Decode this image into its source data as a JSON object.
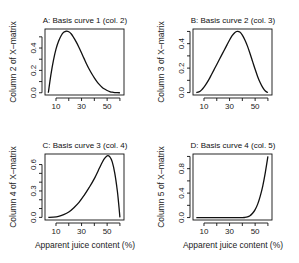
{
  "chart_data": [
    {
      "type": "line",
      "panel": "A",
      "title": "A: Basis curve 1 (col. 2)",
      "xlabel": "",
      "ylabel": "Column 2 of X–matrix",
      "xlim": [
        1.4,
        63.2
      ],
      "ylim": [
        -0.02,
        0.57
      ],
      "xticks": [
        10,
        20,
        30,
        40,
        50,
        60
      ],
      "xtick_labels": [
        "10",
        "",
        "30",
        "",
        "50",
        ""
      ],
      "yticks": [
        0.0,
        0.1,
        0.2,
        0.3,
        0.4,
        0.5
      ],
      "ytick_labels": [
        "0.0",
        "",
        "0.2",
        "",
        "0.4",
        ""
      ],
      "x": [
        4,
        6,
        8,
        10,
        12,
        14,
        16,
        18,
        20,
        22,
        24,
        26,
        28,
        30,
        32,
        34,
        36,
        38,
        40,
        42,
        44,
        46,
        48,
        50,
        52,
        54,
        56,
        58,
        60
      ],
      "y": [
        0.0,
        0.16,
        0.29,
        0.39,
        0.46,
        0.51,
        0.54,
        0.55,
        0.545,
        0.525,
        0.49,
        0.45,
        0.405,
        0.355,
        0.305,
        0.255,
        0.21,
        0.17,
        0.133,
        0.1,
        0.073,
        0.05,
        0.033,
        0.02,
        0.011,
        0.005,
        0.002,
        0.0005,
        0.0
      ]
    },
    {
      "type": "line",
      "panel": "B",
      "title": "B: Basis curve 2 (col. 3)",
      "xlabel": "",
      "ylabel": "Column 3 of X–matrix",
      "xlim": [
        1.4,
        63.2
      ],
      "ylim": [
        -0.02,
        0.52
      ],
      "xticks": [
        10,
        20,
        30,
        40,
        50,
        60
      ],
      "xtick_labels": [
        "10",
        "",
        "30",
        "",
        "50",
        ""
      ],
      "yticks": [
        0.0,
        0.1,
        0.2,
        0.3,
        0.4,
        0.5
      ],
      "ytick_labels": [
        "0.0",
        "",
        "0.2",
        "",
        "0.4",
        ""
      ],
      "x": [
        4,
        6,
        8,
        10,
        12,
        14,
        16,
        18,
        20,
        22,
        24,
        26,
        28,
        30,
        32,
        34,
        36,
        38,
        40,
        42,
        44,
        46,
        48,
        50,
        52,
        54,
        56,
        58,
        60
      ],
      "y": [
        0.0,
        0.005,
        0.02,
        0.045,
        0.075,
        0.11,
        0.15,
        0.19,
        0.23,
        0.27,
        0.31,
        0.35,
        0.39,
        0.43,
        0.465,
        0.49,
        0.5,
        0.495,
        0.47,
        0.43,
        0.38,
        0.32,
        0.255,
        0.19,
        0.13,
        0.08,
        0.04,
        0.012,
        0.0
      ]
    },
    {
      "type": "line",
      "panel": "C",
      "title": "C: Basis curve 3 (col. 4)",
      "xlabel": "Apparent juice content (%)",
      "ylabel": "Column 4 of X–matrix",
      "xlim": [
        1.4,
        63.2
      ],
      "ylim": [
        -0.03,
        0.72
      ],
      "xticks": [
        10,
        20,
        30,
        40,
        50,
        60
      ],
      "xtick_labels": [
        "10",
        "",
        "30",
        "",
        "50",
        ""
      ],
      "yticks": [
        0.0,
        0.1,
        0.2,
        0.3,
        0.4,
        0.5,
        0.6
      ],
      "ytick_labels": [
        "0.0",
        "",
        "",
        "0.3",
        "",
        "",
        "0.6"
      ],
      "x": [
        4,
        8,
        12,
        16,
        20,
        24,
        28,
        32,
        36,
        40,
        44,
        46,
        48,
        50,
        52,
        54,
        56,
        58,
        59,
        60
      ],
      "y": [
        0.0,
        0.002,
        0.01,
        0.03,
        0.06,
        0.11,
        0.17,
        0.25,
        0.34,
        0.44,
        0.56,
        0.62,
        0.67,
        0.7,
        0.69,
        0.63,
        0.5,
        0.3,
        0.16,
        0.0
      ]
    },
    {
      "type": "line",
      "panel": "D",
      "title": "D: Basis curve 4 (col. 5)",
      "xlabel": "Apparent juice content (%)",
      "ylabel": "Column 5 of X–matrix",
      "xlim": [
        1.4,
        63.2
      ],
      "ylim": [
        -0.04,
        1.04
      ],
      "xticks": [
        10,
        20,
        30,
        40,
        50,
        60
      ],
      "xtick_labels": [
        "10",
        "",
        "30",
        "",
        "50",
        ""
      ],
      "yticks": [
        0.0,
        0.2,
        0.4,
        0.6,
        0.8,
        1.0
      ],
      "ytick_labels": [
        "0.0",
        "",
        "0.4",
        "",
        "0.8",
        ""
      ],
      "x": [
        4,
        10,
        20,
        30,
        40,
        42,
        44,
        46,
        48,
        50,
        52,
        54,
        56,
        58,
        60
      ],
      "y": [
        0.0,
        0.0,
        0.0,
        0.0,
        0.0,
        0.002,
        0.01,
        0.03,
        0.07,
        0.13,
        0.22,
        0.35,
        0.52,
        0.74,
        1.0
      ]
    }
  ],
  "panels_layout": [
    {
      "panel": "A",
      "box": [
        45,
        29,
        124,
        95
      ]
    },
    {
      "panel": "B",
      "box": [
        193,
        29,
        272,
        95
      ]
    },
    {
      "panel": "C",
      "box": [
        45,
        154,
        124,
        220
      ]
    },
    {
      "panel": "D",
      "box": [
        193,
        154,
        272,
        220
      ]
    }
  ]
}
